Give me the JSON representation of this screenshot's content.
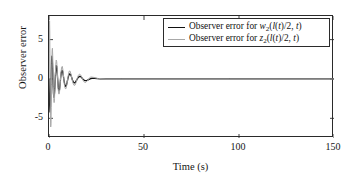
{
  "chart_data": {
    "type": "line",
    "title": "",
    "xlabel": "Time (s)",
    "ylabel": "Observer error",
    "xlim": [
      0,
      150
    ],
    "ylim": [
      -7.5,
      8.0
    ],
    "xticks": [
      0,
      50,
      100,
      150
    ],
    "xticklabels": [
      "0",
      "50",
      "100",
      "150"
    ],
    "yticks": [
      5,
      0,
      -5
    ],
    "yticklabels": [
      "5",
      "0",
      "-5"
    ],
    "grid": false,
    "legend_position": "top-right",
    "series": [
      {
        "name": "Observer error for w2(l(t)/2, t)",
        "label_prefix": "Observer error for ",
        "label_var": "w",
        "label_sub": "2",
        "label_suffix": "(l(t)/2, t)",
        "color": "#111111",
        "style": "solid",
        "width": 1.3,
        "x": [
          0.0,
          0.15,
          0.35,
          0.55,
          0.75,
          0.95,
          1.15,
          1.35,
          1.55,
          1.75,
          1.95,
          2.15,
          2.35,
          2.55,
          2.8,
          3.05,
          3.3,
          3.55,
          3.8,
          4.05,
          4.3,
          4.6,
          4.9,
          5.2,
          5.5,
          5.8,
          6.1,
          6.45,
          6.8,
          7.15,
          7.5,
          7.9,
          8.3,
          8.7,
          9.1,
          9.5,
          9.95,
          10.4,
          10.85,
          11.3,
          11.8,
          12.3,
          12.8,
          13.3,
          13.85,
          14.4,
          14.95,
          15.5,
          16.1,
          16.7,
          17.3,
          17.9,
          18.6,
          19.3,
          20.0,
          20.8,
          21.6,
          22.5,
          24.0,
          27.0,
          32.0,
          40.0,
          55.0,
          75.0,
          100.0,
          125.0,
          150.0
        ],
        "y": [
          0.0,
          -1.6,
          -3.3,
          -4.2,
          -3.6,
          -1.8,
          0.6,
          2.3,
          2.9,
          2.4,
          1.1,
          -0.6,
          -1.8,
          -2.3,
          -2.1,
          -1.2,
          0.1,
          1.2,
          1.7,
          1.6,
          0.9,
          -0.2,
          -1.1,
          -1.5,
          -1.4,
          -0.8,
          0.1,
          0.8,
          1.1,
          1.0,
          0.5,
          -0.2,
          -0.7,
          -0.95,
          -0.85,
          -0.45,
          0.05,
          0.45,
          0.65,
          0.6,
          0.3,
          -0.1,
          -0.38,
          -0.5,
          -0.44,
          -0.22,
          0.03,
          0.24,
          0.33,
          0.3,
          0.15,
          -0.04,
          -0.17,
          -0.21,
          -0.17,
          -0.08,
          0.02,
          0.09,
          0.07,
          0.02,
          0.0,
          0.0,
          0.0,
          0.0,
          0.0,
          0.0,
          0.0
        ]
      },
      {
        "name": "Observer error for z2(l(t)/2, t)",
        "label_prefix": "Observer error for ",
        "label_var": "z",
        "label_sub": "2",
        "label_suffix": "(l(t)/2, t)",
        "color": "#a8a8a8",
        "style": "solid",
        "width": 1.0,
        "x": [
          0.0,
          0.1,
          0.2,
          0.3,
          0.4,
          0.5,
          0.62,
          0.75,
          0.9,
          1.05,
          1.2,
          1.35,
          1.5,
          1.65,
          1.8,
          1.95,
          2.1,
          2.3,
          2.5,
          2.7,
          2.9,
          3.1,
          3.3,
          3.55,
          3.8,
          4.05,
          4.3,
          4.55,
          4.8,
          5.1,
          5.4,
          5.7,
          6.0,
          6.3,
          6.65,
          7.0,
          7.35,
          7.7,
          8.1,
          8.5,
          8.9,
          9.3,
          9.75,
          10.2,
          10.65,
          11.1,
          11.6,
          12.1,
          12.6,
          13.15,
          13.7,
          14.25,
          14.85,
          15.45,
          16.05,
          16.7,
          17.35,
          18.0,
          18.7,
          19.4,
          20.2,
          21.0,
          22.0,
          23.5,
          26.0,
          30.0,
          38.0,
          50.0,
          70.0,
          95.0,
          120.0,
          150.0
        ],
        "y": [
          0.0,
          3.2,
          6.2,
          7.4,
          6.1,
          2.8,
          -1.4,
          -4.6,
          -6.1,
          -5.7,
          -3.6,
          -0.7,
          2.0,
          3.6,
          3.9,
          3.0,
          1.3,
          -1.0,
          -2.5,
          -3.0,
          -2.5,
          -1.2,
          0.4,
          1.8,
          2.4,
          2.2,
          1.3,
          0.0,
          -1.2,
          -1.9,
          -1.9,
          -1.3,
          -0.2,
          0.8,
          1.5,
          1.6,
          1.1,
          0.2,
          -0.7,
          -1.2,
          -1.25,
          -0.85,
          -0.15,
          0.55,
          1.0,
          1.0,
          0.6,
          0.0,
          -0.5,
          -0.8,
          -0.78,
          -0.45,
          0.05,
          0.45,
          0.62,
          0.5,
          0.15,
          -0.2,
          -0.42,
          -0.42,
          -0.22,
          0.05,
          0.25,
          0.2,
          0.05,
          0.0,
          0.0,
          0.0,
          0.0,
          0.0,
          0.0,
          0.0
        ]
      }
    ]
  }
}
